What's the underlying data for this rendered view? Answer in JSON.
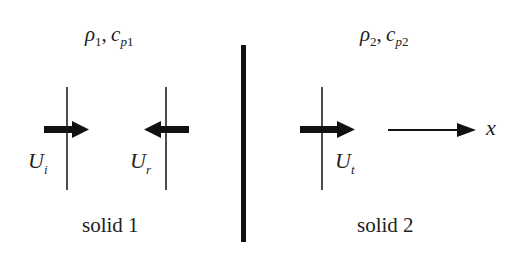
{
  "diagram": {
    "regions": [
      {
        "label": "solid 1",
        "density_symbol": "ρ",
        "density_subscript": "1",
        "heat_capacity_symbol": "c",
        "heat_capacity_subscript_italic": "p",
        "heat_capacity_subscript_index": "1",
        "separator": ","
      },
      {
        "label": "solid 2",
        "density_symbol": "ρ",
        "density_subscript": "2",
        "heat_capacity_symbol": "c",
        "heat_capacity_subscript_italic": "p",
        "heat_capacity_subscript_index": "2",
        "separator": ","
      }
    ],
    "waves": [
      {
        "name": "incident",
        "symbol": "U",
        "subscript": "i",
        "direction": "right"
      },
      {
        "name": "reflected",
        "symbol": "U",
        "subscript": "r",
        "direction": "left"
      },
      {
        "name": "transmitted",
        "symbol": "U",
        "subscript": "t",
        "direction": "right"
      }
    ],
    "axis": {
      "label": "x",
      "direction": "right"
    },
    "colors": {
      "stroke": "#111111",
      "text": "#222222",
      "background": "#ffffff"
    }
  }
}
